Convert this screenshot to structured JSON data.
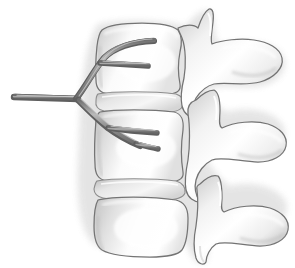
{
  "figure": {
    "view": "lateral",
    "background_color": "#ffffff",
    "caption": ""
  },
  "palette": {
    "bone_outline": "#6f6f6f",
    "bone_fill_light": "#fdfdfd",
    "bone_fill_mid": "#e2e2e2",
    "bone_fill_shadow": "#bdbdbd",
    "bone_halo": "#d8d8d8",
    "nerve_fill": "#8e8e8e",
    "nerve_outline": "#5d5d5d",
    "nerve_highlight": "#c9c9c9",
    "disc_line": "#9a9a9a"
  },
  "structures": {
    "vertebrae": [
      {
        "id": "vertebra-1",
        "label": "Upper lumbar vertebra",
        "body_label": "Vertebral body",
        "spinous_label": "Spinous process",
        "articular_label": "Superior articular process",
        "body_top_y": 26,
        "body_bottom_y": 93
      },
      {
        "id": "vertebra-2",
        "label": "Middle lumbar vertebra",
        "body_label": "Vertebral body",
        "spinous_label": "Spinous process",
        "articular_label": "Superior articular process",
        "body_top_y": 110,
        "body_bottom_y": 176
      },
      {
        "id": "vertebra-3",
        "label": "Lower lumbar vertebra",
        "body_label": "Vertebral body",
        "spinous_label": "Spinous process",
        "articular_label": "Inferior articular process",
        "body_top_y": 192,
        "body_bottom_y": 256
      }
    ],
    "discs": [
      {
        "id": "disc-1",
        "label": "Intervertebral disc",
        "top_y": 93,
        "bottom_y": 110
      },
      {
        "id": "disc-2",
        "label": "Intervertebral disc",
        "top_y": 176,
        "bottom_y": 192
      }
    ],
    "nerves": [
      {
        "id": "nerve-trunk",
        "label": "Spinal nerve trunk",
        "start_x": 14,
        "start_y": 98,
        "end_x": 80,
        "end_y": 99
      },
      {
        "id": "nerve-branch-superior",
        "label": "Ascending nerve branch",
        "terminus_x": 156,
        "terminus_y": 42
      },
      {
        "id": "nerve-branch-superior-fork",
        "label": "Ascending nerve sub-branch",
        "terminus_x": 150,
        "terminus_y": 67
      },
      {
        "id": "nerve-branch-inferior-upper",
        "label": "Descending nerve branch",
        "terminus_x": 158,
        "terminus_y": 133
      },
      {
        "id": "nerve-branch-inferior-lower",
        "label": "Descending nerve sub-branch",
        "terminus_x": 158,
        "terminus_y": 150
      }
    ]
  }
}
